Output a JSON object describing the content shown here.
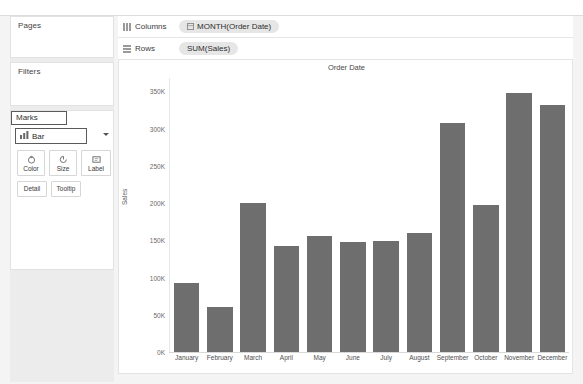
{
  "app": {
    "left_rail": {
      "pages": {
        "title": "Pages"
      },
      "filters": {
        "title": "Filters"
      },
      "marks": {
        "title": "Marks",
        "mark_type": "Bar",
        "dropdown_icon": "chevron-down-icon",
        "mark_type_icon": "bar-chart-icon",
        "buttons": [
          {
            "label": "Color",
            "icon": "color-palette-icon"
          },
          {
            "label": "Size",
            "icon": "size-circle-icon"
          },
          {
            "label": "Label",
            "icon": "label-tag-icon"
          },
          {
            "label": "Detail",
            "icon": ""
          },
          {
            "label": "Tooltip",
            "icon": ""
          }
        ]
      }
    },
    "shelves": [
      {
        "name": "columns",
        "label": "Columns",
        "icon": "columns-grid-icon",
        "pill": "MONTH(Order Date)",
        "pill_icon": "date-field-icon"
      },
      {
        "name": "rows",
        "label": "Rows",
        "icon": "rows-grid-icon",
        "pill": "SUM(Sales)",
        "pill_icon": ""
      }
    ]
  },
  "chart_data": {
    "type": "bar",
    "title": "Order Date",
    "xlabel": "",
    "ylabel": "Sales",
    "grid": false,
    "legend": "none",
    "bar_color": "#6e6e6e",
    "categories": [
      "January",
      "February",
      "March",
      "April",
      "May",
      "June",
      "July",
      "August",
      "September",
      "October",
      "November",
      "December"
    ],
    "values": [
      93000,
      60000,
      200000,
      142000,
      156000,
      148000,
      149000,
      160000,
      308000,
      197000,
      348000,
      332000
    ],
    "ylim": [
      0,
      368000
    ],
    "ytick_values": [
      0,
      50000,
      100000,
      150000,
      200000,
      250000,
      300000,
      350000
    ],
    "ytick_labels": [
      "0K",
      "50K",
      "100K",
      "150K",
      "200K",
      "250K",
      "300K",
      "350K"
    ]
  }
}
